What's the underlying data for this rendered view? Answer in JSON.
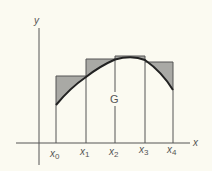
{
  "figure": {
    "axis_labels": {
      "x": "x",
      "y": "y"
    },
    "region_label": "G",
    "ticks": [
      {
        "base": "x",
        "sub": "0"
      },
      {
        "base": "x",
        "sub": "1"
      },
      {
        "base": "x",
        "sub": "2"
      },
      {
        "base": "x",
        "sub": "3"
      },
      {
        "base": "x",
        "sub": "4"
      }
    ],
    "colors": {
      "background": "#fbfaf1",
      "line": "#555555",
      "curve": "#222222",
      "shading": "#a9a9a5"
    }
  }
}
